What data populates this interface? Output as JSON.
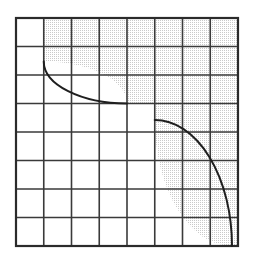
{
  "figure": {
    "title": "Shaded region bounded by two arcs on an 8 by 8 grid",
    "type": "geometric-diagram",
    "background_color": "#ffffff",
    "canvas": {
      "width": 255,
      "height": 275
    }
  },
  "grid": {
    "name": "square-grid",
    "columns": 8,
    "rows": 8,
    "left": 16,
    "top": 18,
    "right": 238,
    "bottom": 246,
    "cell_width": 27.75,
    "cell_height": 28.5,
    "outer_border_color": "#2b2b2b",
    "outer_border_width": 2.2,
    "inner_line_color": "#3a3a3a",
    "inner_line_width": 1.6,
    "x_positions": [
      16,
      43.75,
      71.5,
      99.25,
      127,
      154.75,
      182.5,
      210.25,
      238
    ],
    "y_positions": [
      18,
      46.5,
      75,
      103.5,
      132,
      160.5,
      189,
      217.5,
      246
    ]
  },
  "shading": {
    "name": "stipple-fill",
    "pattern": "dotted",
    "dot_color": "#6f6f6f",
    "fill_background": "#ffffff",
    "dot_spacing": 2,
    "dot_radius": 0.42,
    "description": "fine gray stipple dots"
  },
  "curves": [
    {
      "name": "upper-left-arc",
      "type": "arc",
      "start": [
        43.75,
        61.5
      ],
      "end": [
        127,
        103.5
      ],
      "center": [
        43.75,
        103.5
      ],
      "radius_x": 83.25,
      "radius_y": 42,
      "sweep": "clockwise",
      "stroke_color": "#1f1f1f",
      "stroke_width": 2
    },
    {
      "name": "lower-right-arc",
      "type": "arc",
      "start": [
        154.75,
        120
      ],
      "end": [
        232,
        246
      ],
      "center": [
        232,
        120
      ],
      "radius_x": 77.25,
      "radius_y": 126,
      "sweep": "counterclockwise",
      "stroke_color": "#1f1f1f",
      "stroke_width": 2
    }
  ],
  "regions": [
    {
      "name": "upper-shaded-band",
      "shaded": true,
      "description": "Shaded band across the top right of the grid above the upper-left arc"
    },
    {
      "name": "right-shaded-region",
      "shaded": true,
      "description": "Shaded region right of the lower-right arc down to the bottom edge"
    },
    {
      "name": "top-left-white-cell",
      "shaded": false,
      "description": "Unshaded cell in the top left corner of the grid"
    },
    {
      "name": "central-white-region",
      "shaded": false,
      "description": "Unshaded region below the upper-left arc and left of the lower-right arc"
    }
  ],
  "shaded_area_path": "M 43.75 18 L 238 18 L 238 246 L 232 246 A 77.25 126 0 0 1 154.75 120 L 154.75 103.5 L 127 103.5 A 83.25 42 0 0 0 43.75 61.5 Z"
}
